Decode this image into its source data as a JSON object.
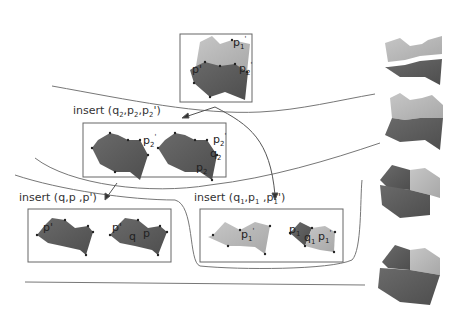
{
  "colors": {
    "dark_poly": "#5e5e5e",
    "light_poly": "#b8b8b8",
    "box_stroke": "#666666",
    "curve_stroke": "#777777",
    "vertex": "#222222"
  },
  "top_box": {
    "labels": {
      "p_prime": "p'",
      "p1_prime": "p1'",
      "p2_prime": "p2'"
    }
  },
  "box_q2": {
    "caption": "insert (q2,p2,p2')",
    "left_labels": {
      "p2_prime": "p2'"
    },
    "right_labels": {
      "p2_prime": "p2'",
      "q2": "q2",
      "p2": "p2"
    }
  },
  "box_q": {
    "caption": "insert (q,p ,p')",
    "left_labels": {
      "p_prime": "p'"
    },
    "right_labels": {
      "p_prime": "p'",
      "q": "q",
      "p": "p"
    }
  },
  "box_q1": {
    "caption": "insert (q1,p1 ,p1')",
    "left_labels": {
      "p1_prime": "p1'"
    },
    "right_labels": {
      "p1": "p1",
      "q1": "q1",
      "p1_prime": "p1'"
    }
  },
  "right_column": {
    "steps": [
      "step-1",
      "step-2",
      "step-3",
      "step-4"
    ]
  }
}
